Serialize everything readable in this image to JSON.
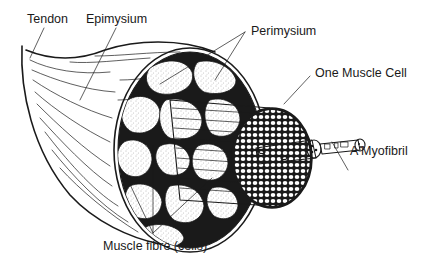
{
  "diagram": {
    "type": "anatomical-illustration",
    "style": "black ink line drawing on white",
    "labels": {
      "tendon": "Tendon",
      "epimysium": "Epimysium",
      "perimysium": "Perimysium",
      "one_muscle_cell": "One Muscle Cell",
      "myofibril": "A Myofibril",
      "muscle_fibre": "Muscle fibre (cells)"
    },
    "colors": {
      "ink": "#1a1a1a",
      "background": "#ffffff",
      "stipple": "#888888"
    }
  }
}
